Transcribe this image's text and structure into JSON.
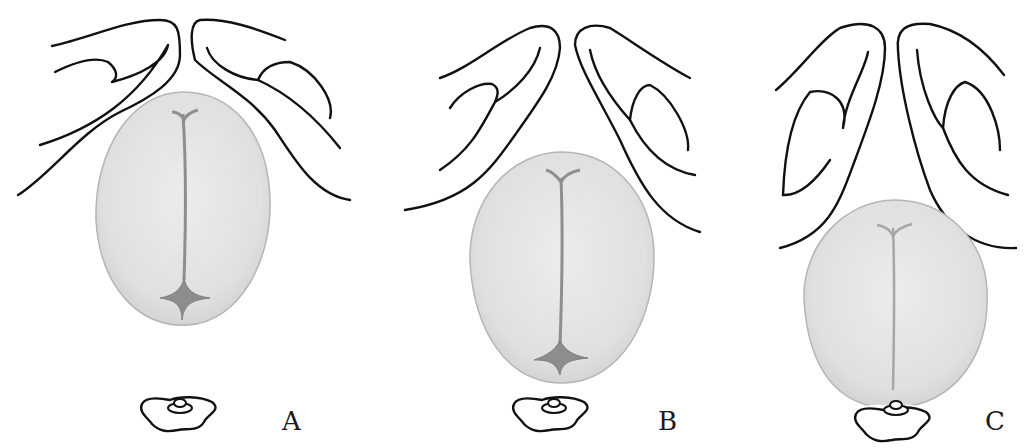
{
  "figure": {
    "panels": [
      {
        "id": "A",
        "label": "A",
        "head_top": 92,
        "head_bottom": 326
      },
      {
        "id": "B",
        "label": "B",
        "head_top": 152,
        "head_bottom": 384
      },
      {
        "id": "C",
        "label": "C",
        "head_top": 200,
        "head_bottom": 408
      }
    ],
    "colors": {
      "background": "#ffffff",
      "line": "#111111",
      "head_fill": "#e2e2e2",
      "head_edge": "#b8b8b8",
      "suture": "#8e8e8e",
      "fontanelle": "#8a8a8a"
    }
  }
}
